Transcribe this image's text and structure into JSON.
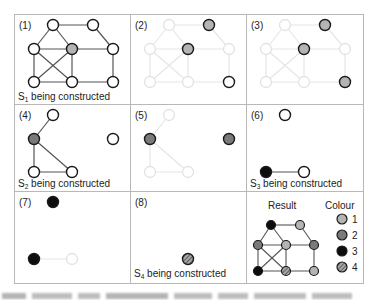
{
  "colors": {
    "grid_line": "#b8b8b8",
    "edge": "#555555",
    "edge_faded": "#e6e6e6",
    "node_stroke": "#1a1a1a",
    "node_stroke_faded": "#e2e2e2",
    "colour_1": "#b4b4b4",
    "colour_2": "#7a7a7a",
    "colour_3": "#0d0d0d",
    "colour_4_base": "#9a9a9a",
    "white": "#ffffff"
  },
  "panels": [
    {
      "id": 1,
      "label": "(1)",
      "caption": "being constructed",
      "set_name": "S",
      "set_sub": "1"
    },
    {
      "id": 2,
      "label": "(2)",
      "caption": "",
      "set_name": "",
      "set_sub": ""
    },
    {
      "id": 3,
      "label": "(3)",
      "caption": "",
      "set_name": "",
      "set_sub": ""
    },
    {
      "id": 4,
      "label": "(4)",
      "caption": "being constructed",
      "set_name": "S",
      "set_sub": "2"
    },
    {
      "id": 5,
      "label": "(5)",
      "caption": "",
      "set_name": "",
      "set_sub": ""
    },
    {
      "id": 6,
      "label": "(6)",
      "caption": "being constructed",
      "set_name": "S",
      "set_sub": "3"
    },
    {
      "id": 7,
      "label": "(7)",
      "caption": "",
      "set_name": "",
      "set_sub": ""
    },
    {
      "id": 8,
      "label": "(8)",
      "caption": "being constructed",
      "set_name": "S",
      "set_sub": "4"
    },
    {
      "id": 9,
      "label": "",
      "caption": "",
      "set_name": "",
      "set_sub": ""
    }
  ],
  "result": {
    "title": "Result",
    "legend_title": "Colour",
    "legend": [
      {
        "label": "1",
        "colour": "light-grey"
      },
      {
        "label": "2",
        "colour": "dark-grey"
      },
      {
        "label": "3",
        "colour": "black"
      },
      {
        "label": "4",
        "colour": "hatched"
      }
    ]
  },
  "graph": {
    "nodes": [
      "t1",
      "t2",
      "m1",
      "m2",
      "m3",
      "b1",
      "b2",
      "b3"
    ],
    "edges": [
      [
        "t1",
        "t2"
      ],
      [
        "t1",
        "m1"
      ],
      [
        "t1",
        "m2"
      ],
      [
        "t2",
        "m3"
      ],
      [
        "m1",
        "m2"
      ],
      [
        "m2",
        "m3"
      ],
      [
        "m1",
        "b1"
      ],
      [
        "m1",
        "b2"
      ],
      [
        "m2",
        "b1"
      ],
      [
        "m2",
        "b2"
      ],
      [
        "m3",
        "b3"
      ],
      [
        "b1",
        "b2"
      ],
      [
        "b2",
        "b3"
      ]
    ],
    "result_colouring": {
      "t1": "3",
      "t2": "1",
      "m1": "2",
      "m2": "1",
      "m3": "2",
      "b1": "3",
      "b2": "4",
      "b3": "1"
    }
  }
}
